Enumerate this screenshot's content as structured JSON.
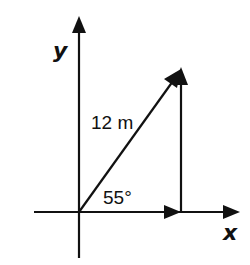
{
  "diagram": {
    "type": "vector-decomposition",
    "colors": {
      "ink": "#111111",
      "background": "#ffffff"
    },
    "axes": {
      "x_label": "x",
      "y_label": "y"
    },
    "vector": {
      "magnitude_label": "12 m",
      "angle_label": "55°",
      "magnitude": 12,
      "unit": "m",
      "angle_deg": 55
    },
    "components": [
      {
        "name": "x-component",
        "direction": "horizontal"
      },
      {
        "name": "y-component",
        "direction": "vertical"
      }
    ]
  }
}
